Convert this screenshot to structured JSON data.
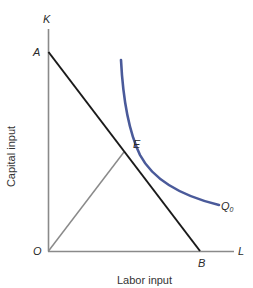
{
  "diagram": {
    "type": "isoquant-isocost",
    "axes": {
      "y_axis_symbol": "K",
      "x_axis_symbol": "L",
      "origin_label": "O",
      "y_title": "Capital input",
      "x_title": "Labor input"
    },
    "points": {
      "A": "A",
      "B": "B",
      "E": "E"
    },
    "curve_label_main": "Q",
    "curve_label_sub": "0",
    "colors": {
      "axis": "#8a8a8a",
      "isocost_line": "#1a1a1a",
      "isoquant_curve": "#4a5a9a",
      "ray": "#8a8a8a"
    }
  }
}
